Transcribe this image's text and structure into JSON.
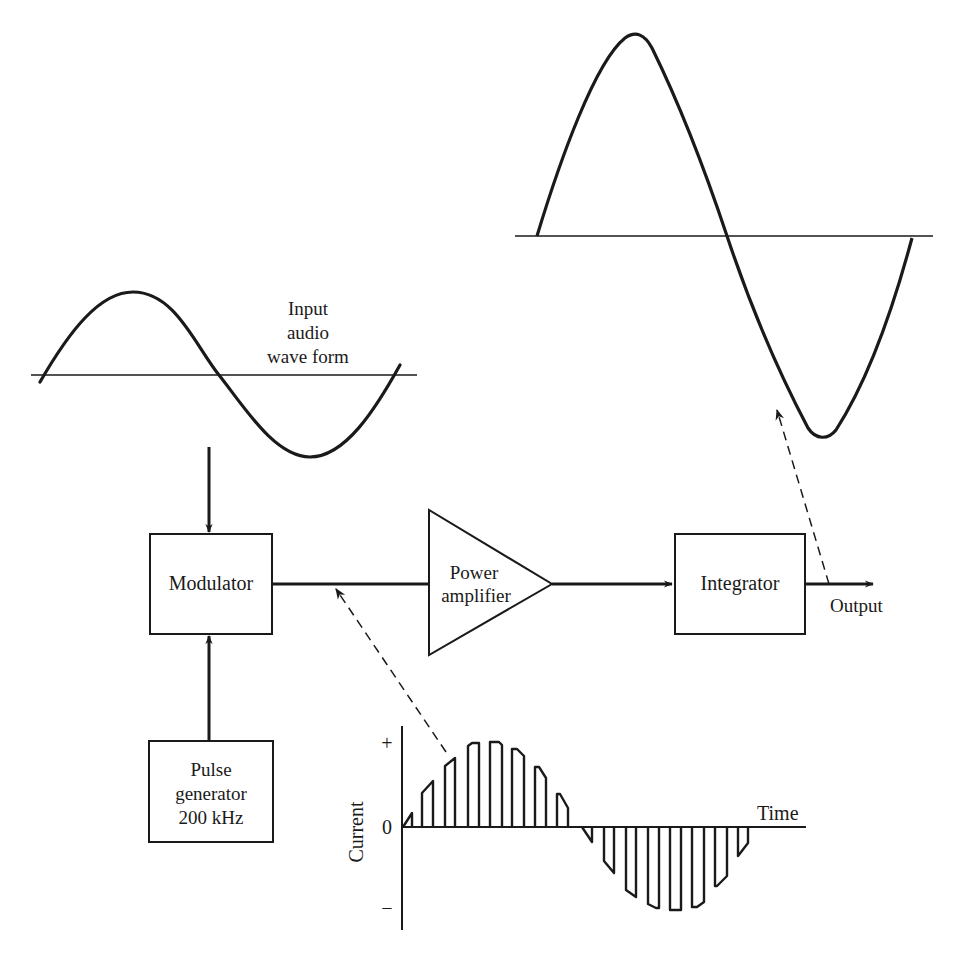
{
  "diagram": {
    "type": "block-diagram",
    "colors": {
      "ink": "#1a1a1a",
      "background": "#ffffff"
    },
    "input_waveform": {
      "label_lines": [
        "Input",
        "audio",
        "wave form"
      ]
    },
    "blocks": {
      "modulator": {
        "label": "Modulator"
      },
      "pulse_generator": {
        "label_lines": [
          "Pulse",
          "generator",
          "200 kHz"
        ]
      },
      "power_amplifier": {
        "label_lines": [
          "Power",
          "amplifier"
        ]
      },
      "integrator": {
        "label": "Integrator"
      }
    },
    "output": {
      "label": "Output"
    },
    "pwm_chart": {
      "y_axis_label": "Current",
      "x_axis_label": "Time",
      "tick_plus": "+",
      "tick_zero": "0",
      "tick_minus": "−"
    },
    "connections": [
      {
        "from": "input_waveform",
        "to": "modulator",
        "style": "arrow"
      },
      {
        "from": "pulse_generator",
        "to": "modulator",
        "style": "arrow"
      },
      {
        "from": "modulator",
        "to": "power_amplifier",
        "style": "line"
      },
      {
        "from": "power_amplifier",
        "to": "integrator",
        "style": "arrow"
      },
      {
        "from": "integrator",
        "to": "output",
        "style": "arrow"
      },
      {
        "from": "pwm_chart",
        "to": "modulator_output_line",
        "style": "dashed-arrow"
      },
      {
        "from": "output_line",
        "to": "output_waveform",
        "style": "dashed-arrow"
      }
    ]
  }
}
